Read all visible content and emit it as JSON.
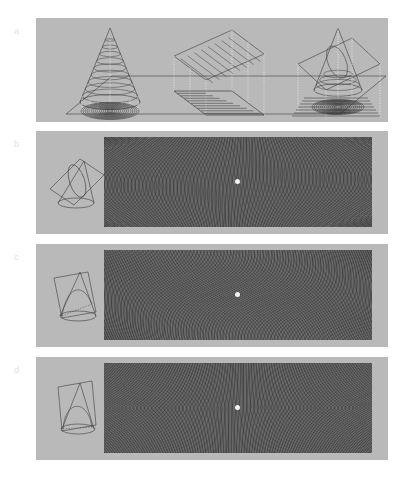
{
  "figure": {
    "background_color": "#ffffff",
    "panel_color": "#b9b9b9",
    "line_color": "#3d3d3d",
    "label_color": "#e2e2e2",
    "dot_color": "#f2f2f2",
    "width": 405,
    "height": 503
  },
  "panels": [
    {
      "id": "a",
      "label": "a",
      "caption": "Cone with circular contour rings, a tilted straight grating plane, and a cone cut by an oblique plane, each projected onto the horizontal ground plane",
      "objects": [
        {
          "name": "contoured-cone",
          "type": "cone",
          "contours": "circular rings",
          "projection": "concentric circular moire rosette"
        },
        {
          "name": "tilted-grating-plane",
          "type": "plane",
          "contours": "parallel straight lines",
          "projection": "parallel straight line grating"
        },
        {
          "name": "cone-with-cutting-plane",
          "type": "cone-and-plane",
          "contours": "ellipse section",
          "projection": "elliptical moire rosette"
        }
      ]
    },
    {
      "id": "b",
      "label": "b",
      "inset_name": "cone-cut-ellipse-inset",
      "section_type": "ellipse",
      "pattern_name": "hyperbolic-moire-field",
      "pattern_description": "Hourglass / bow-tie moire fringes converging to a central singular point",
      "center_point": {
        "x": 238,
        "y": 183
      }
    },
    {
      "id": "c",
      "label": "c",
      "inset_name": "cone-cut-parabola-inset",
      "section_type": "parabola",
      "pattern_name": "elliptical-moire-field",
      "pattern_description": "Concentric elliptical moire rings about a central singular point",
      "center_point": {
        "x": 238,
        "y": 296
      }
    },
    {
      "id": "d",
      "label": "d",
      "inset_name": "cone-cut-hyperbola-inset",
      "section_type": "hyperbola",
      "pattern_name": "bowtie-moire-field",
      "pattern_description": "Sharp bow-tie moire fringes crossing at a central singular point",
      "center_point": {
        "x": 238,
        "y": 409
      }
    }
  ]
}
